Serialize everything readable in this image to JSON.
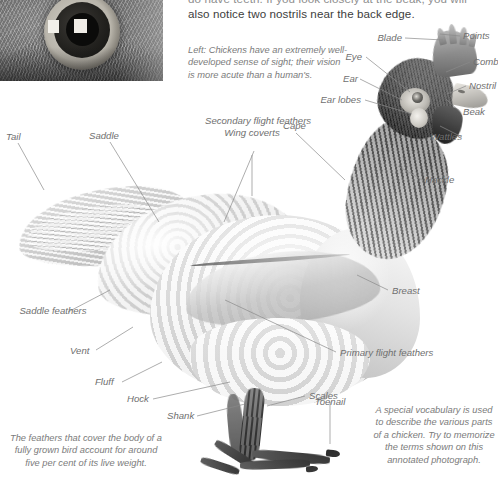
{
  "page": {
    "background_color": "#ffffff",
    "label_color": "#6f6f6f",
    "leader_line_color": "#8a8a8a"
  },
  "body_text": {
    "line_clipped": "do have teeth. If you look closely at the beak, you will",
    "line_2": "also notice two nostrils near the back edge."
  },
  "captions": {
    "left": "Left: Chickens have an extremely well-developed sense of sight; their vision is more acute than a human's.",
    "bottom_left": "The feathers that cover the body of a fully grown bird account for around five per cent of its live weight.",
    "bottom_right": "A special vocabulary is used to describe the various parts of a chicken. Try to memorize the terms shown on this annotated photograph."
  },
  "photos": {
    "eye_inset_alt": "close-up photograph of a chicken's eye",
    "main_alt": "side-view photograph of a white chicken"
  },
  "labels": {
    "blade": "Blade",
    "points": "Points",
    "eye": "Eye",
    "comb": "Comb",
    "ear": "Ear",
    "nostril": "Nostril",
    "ear_lobes": "Ear lobes",
    "beak": "Beak",
    "wattles": "Wattles",
    "hackle": "Hackle",
    "cape": "Cape",
    "wing_coverts": "Wing coverts",
    "secondary_flight_feathers": "Secondary flight feathers",
    "saddle": "Saddle",
    "tail": "Tail",
    "saddle_feathers": "Saddle feathers",
    "vent": "Vent",
    "fluff": "Fluff",
    "hock": "Hock",
    "shank": "Shank",
    "scales": "Scales",
    "toenail": "Toenail",
    "breast": "Breast",
    "primary_flight_feathers": "Primary flight feathers"
  }
}
